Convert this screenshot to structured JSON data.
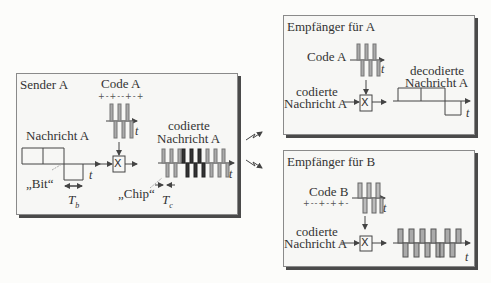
{
  "sender": {
    "title": "Sender A",
    "code_label": "Code A",
    "code_sequence": "+-+--+-+",
    "message_label": "Nachricht A",
    "bit_label": "„Bit“",
    "bit_period": "T",
    "bit_period_sub": "b",
    "chip_label": "„Chip“",
    "chip_period": "T",
    "chip_period_sub": "c",
    "encoded_label_1": "codierte",
    "encoded_label_2": "Nachricht A",
    "time_axis": "t",
    "multiplier_symbol": "X"
  },
  "receiver_a": {
    "title": "Empfänger für A",
    "code_label": "Code A",
    "input_label_1": "codierte",
    "input_label_2": "Nachricht A",
    "output_label_1": "decodierte",
    "output_label_2": "Nachricht A",
    "time_axis": "t",
    "multiplier_symbol": "X"
  },
  "receiver_b": {
    "title": "Empfänger für B",
    "code_label": "Code B",
    "code_sequence": "+--+-++-",
    "input_label_1": "codierte",
    "input_label_2": "Nachricht A",
    "time_axis": "t",
    "multiplier_symbol": "X"
  },
  "colors": {
    "box_bg": "#f7f7f5",
    "box_border": "#8a8a8a",
    "box_shadow": "#4a4a4a",
    "line": "#444444",
    "chip_light": "#9a9a9a",
    "chip_dark": "#2a2a2a"
  }
}
